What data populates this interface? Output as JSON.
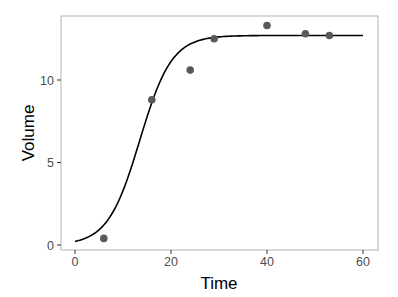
{
  "chart_data": {
    "type": "scatter",
    "title": "",
    "xlabel": "Time",
    "ylabel": "Volume",
    "xlim": [
      -2.5,
      62.5
    ],
    "ylim": [
      -0.3,
      13.9
    ],
    "xticks": [
      0,
      20,
      40,
      60
    ],
    "yticks": [
      0,
      5,
      10
    ],
    "grid": false,
    "legend": null,
    "series": [
      {
        "name": "observed",
        "kind": "points",
        "color": "#595959",
        "points": [
          {
            "x": 6,
            "y": 0.4
          },
          {
            "x": 16,
            "y": 8.8
          },
          {
            "x": 24,
            "y": 10.6
          },
          {
            "x": 29,
            "y": 12.5
          },
          {
            "x": 40,
            "y": 13.3
          },
          {
            "x": 48,
            "y": 12.8
          },
          {
            "x": 53,
            "y": 12.7
          }
        ]
      },
      {
        "name": "fitted logistic curve",
        "kind": "line",
        "color": "#000000",
        "model": {
          "K": 12.7,
          "r": 0.3,
          "t0": 13.5
        },
        "x_range": [
          0,
          60
        ]
      }
    ]
  }
}
